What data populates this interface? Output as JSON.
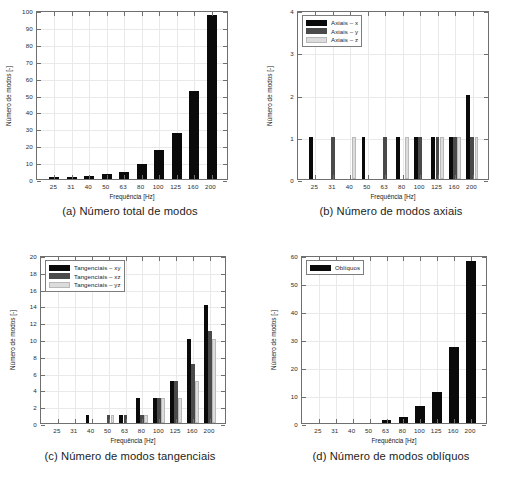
{
  "figure": {
    "axis_label_x": "Frequência [Hz]",
    "axis_label_y": "Número de modos [-]",
    "categories": [
      "25",
      "31",
      "40",
      "50",
      "63",
      "80",
      "100",
      "125",
      "160",
      "200"
    ],
    "colors": {
      "series_x": "#0a0a0a",
      "series_y": "#4a4a4a",
      "series_z": "#dcdcdc",
      "frame": "#6f6f6f"
    }
  },
  "panels": [
    {
      "id": "a",
      "caption": "(a) Número total de modos",
      "legend": null
    },
    {
      "id": "b",
      "caption": "(b) Número de modos axiais",
      "legend": [
        "Axiais – x",
        "Axiais – y",
        "Axiais – z"
      ]
    },
    {
      "id": "c",
      "caption": "(c) Número de modos tangenciais",
      "legend": [
        "Tangenciais – xy",
        "Tangenciais – xz",
        "Tangenciais – yz"
      ]
    },
    {
      "id": "d",
      "caption": "(d) Número de modos oblíquos",
      "legend": [
        "Oblíquos"
      ]
    }
  ],
  "chart_data": [
    {
      "type": "bar",
      "panel": "a",
      "title": "(a) Número total de modos",
      "xlabel": "Frequência [Hz]",
      "ylabel": "Número de modos [-]",
      "categories": [
        "25",
        "31",
        "40",
        "50",
        "63",
        "80",
        "100",
        "125",
        "160",
        "200"
      ],
      "series": [
        {
          "name": "Total",
          "color": "#0a0a0a",
          "values": [
            1,
            1,
            2,
            3,
            4,
            9,
            17,
            27,
            52,
            97
          ]
        }
      ],
      "ylim": [
        0,
        100
      ],
      "yticks": [
        0,
        10,
        20,
        30,
        40,
        50,
        60,
        70,
        80,
        90,
        100
      ],
      "grid": true,
      "legend": "none"
    },
    {
      "type": "bar",
      "panel": "b",
      "title": "(b) Número de modos axiais",
      "xlabel": "Frequência [Hz]",
      "ylabel": "Número de modos [-]",
      "categories": [
        "25",
        "31",
        "40",
        "50",
        "63",
        "80",
        "100",
        "125",
        "160",
        "200"
      ],
      "series": [
        {
          "name": "Axiais – x",
          "color": "#0a0a0a",
          "values": [
            1,
            0,
            0,
            1,
            0,
            1,
            1,
            1,
            1,
            2
          ]
        },
        {
          "name": "Axiais – y",
          "color": "#4a4a4a",
          "values": [
            0,
            1,
            0,
            0,
            1,
            0,
            1,
            1,
            1,
            1
          ]
        },
        {
          "name": "Axiais – z",
          "color": "#dcdcdc",
          "values": [
            0,
            0,
            1,
            0,
            0,
            1,
            0,
            1,
            1,
            1
          ]
        }
      ],
      "ylim": [
        0,
        4
      ],
      "yticks": [
        0,
        1,
        2,
        3,
        4
      ],
      "grid": true,
      "legend": "upper left"
    },
    {
      "type": "bar",
      "panel": "c",
      "title": "(c) Número de modos tangenciais",
      "xlabel": "Frequência [Hz]",
      "ylabel": "Número de modos [-]",
      "categories": [
        "25",
        "31",
        "40",
        "50",
        "63",
        "80",
        "100",
        "125",
        "160",
        "200"
      ],
      "series": [
        {
          "name": "Tangenciais – xy",
          "color": "#0a0a0a",
          "values": [
            0,
            0,
            1,
            0,
            1,
            3,
            3,
            5,
            10,
            14
          ]
        },
        {
          "name": "Tangenciais – xz",
          "color": "#4a4a4a",
          "values": [
            0,
            0,
            0,
            1,
            1,
            1,
            3,
            5,
            7,
            11
          ]
        },
        {
          "name": "Tangenciais – yz",
          "color": "#dcdcdc",
          "values": [
            0,
            0,
            0,
            1,
            0,
            1,
            3,
            3,
            5,
            10
          ]
        }
      ],
      "ylim": [
        0,
        20
      ],
      "yticks": [
        0,
        2,
        4,
        6,
        8,
        10,
        12,
        14,
        16,
        18,
        20
      ],
      "grid": true,
      "legend": "upper left"
    },
    {
      "type": "bar",
      "panel": "d",
      "title": "(d) Número de modos oblíquos",
      "xlabel": "Frequência [Hz]",
      "ylabel": "Número de modos [-]",
      "categories": [
        "25",
        "31",
        "40",
        "50",
        "63",
        "80",
        "100",
        "125",
        "160",
        "200"
      ],
      "series": [
        {
          "name": "Oblíquos",
          "color": "#0a0a0a",
          "values": [
            0,
            0,
            0,
            0,
            1,
            2,
            6,
            11,
            27,
            58
          ]
        }
      ],
      "ylim": [
        0,
        60
      ],
      "yticks": [
        0,
        10,
        20,
        30,
        40,
        50,
        60
      ],
      "grid": true,
      "legend": "upper left"
    }
  ]
}
